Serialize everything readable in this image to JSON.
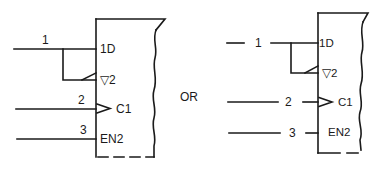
{
  "diagram": {
    "type": "logic-symbol-equivalence",
    "separator_label": "OR",
    "left_symbol": {
      "inputs": [
        {
          "pin": "1",
          "qualifier": "1D"
        },
        {
          "pin": "2",
          "qualifier": "C1"
        },
        {
          "pin": "3",
          "qualifier": "EN2"
        }
      ],
      "output_qualifier": "▽2"
    },
    "right_symbol": {
      "inputs": [
        {
          "pin": "1",
          "qualifier": "1D"
        },
        {
          "pin": "2",
          "qualifier": "C1"
        },
        {
          "pin": "3",
          "qualifier": "EN2"
        }
      ],
      "output_qualifier": "▽2"
    },
    "colors": {
      "ink": "#1a1a1a",
      "background": "#ffffff"
    }
  }
}
